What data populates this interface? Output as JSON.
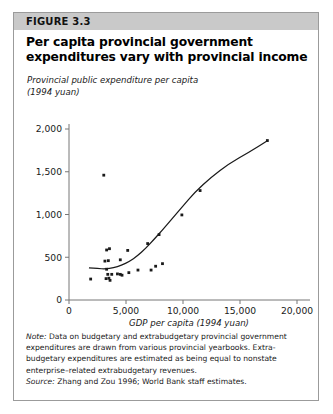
{
  "figure": {
    "number_label": "FIGURE 3.3",
    "title": "Per capita provincial government expenditures vary with provincial income",
    "banner_color": "#c9c9c9",
    "border_color": "#9b9b9b"
  },
  "notes": {
    "note_label": "Note:",
    "note_text": " Data on budgetary and extrabudgetary provincial government expenditures are drawn from various provincial yearbooks. Extra-budgetary expenditures are estimated as being equal to nonstate enterprise–related extrabudgetary revenues.",
    "source_label": "Source:",
    "source_text": " Zhang and Zou 1996; World Bank staff estimates."
  },
  "chart_data": {
    "type": "scatter",
    "title": "Per capita provincial government expenditures vary with provincial income",
    "ylabel": "Provincial public expenditure per capita (1994 yuan)",
    "ylabel_line1": "Provincial public expenditure per capita",
    "ylabel_line2": "(1994 yuan)",
    "xlabel": "GDP per capita (1994 yuan)",
    "xlim": [
      0,
      20000
    ],
    "ylim": [
      0,
      2000
    ],
    "xticks": [
      0,
      5000,
      10000,
      15000,
      20000
    ],
    "xtick_labels": [
      "0",
      "5,000",
      "10,000",
      "15,000",
      "20,000"
    ],
    "yticks": [
      0,
      500,
      1000,
      1500,
      2000
    ],
    "ytick_labels": [
      "0",
      "500",
      "1,000",
      "1,500",
      "2,000"
    ],
    "grid": false,
    "legend": false,
    "marker_color": "#1a1a1a",
    "line_color": "#1a1a1a",
    "points": [
      [
        1900,
        245
      ],
      [
        3050,
        1460
      ],
      [
        3300,
        585
      ],
      [
        3550,
        600
      ],
      [
        3150,
        455
      ],
      [
        3450,
        460
      ],
      [
        3300,
        360
      ],
      [
        3400,
        300
      ],
      [
        3250,
        250
      ],
      [
        3500,
        255
      ],
      [
        3600,
        230
      ],
      [
        3750,
        300
      ],
      [
        4250,
        305
      ],
      [
        4500,
        300
      ],
      [
        4500,
        470
      ],
      [
        4650,
        290
      ],
      [
        5150,
        580
      ],
      [
        5250,
        320
      ],
      [
        6050,
        350
      ],
      [
        6900,
        660
      ],
      [
        7200,
        350
      ],
      [
        7900,
        765
      ],
      [
        8200,
        425
      ],
      [
        7600,
        395
      ],
      [
        9900,
        995
      ],
      [
        11500,
        1280
      ],
      [
        17400,
        1865
      ]
    ],
    "trend_line": {
      "label": "fitted curve",
      "points": [
        [
          1750,
          375
        ],
        [
          2500,
          368
        ],
        [
          3200,
          363
        ],
        [
          3900,
          375
        ],
        [
          4600,
          405
        ],
        [
          5300,
          452
        ],
        [
          6000,
          515
        ],
        [
          6700,
          600
        ],
        [
          7400,
          700
        ],
        [
          8200,
          820
        ],
        [
          9000,
          945
        ],
        [
          10000,
          1100
        ],
        [
          11000,
          1255
        ],
        [
          12500,
          1440
        ],
        [
          14000,
          1590
        ],
        [
          15800,
          1730
        ],
        [
          17400,
          1862
        ]
      ]
    }
  }
}
